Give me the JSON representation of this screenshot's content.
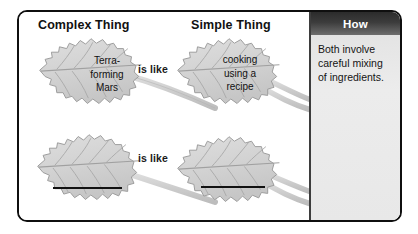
{
  "diagram": {
    "type": "analogy-graphic-organizer",
    "columns": {
      "complex_heading": "Complex Thing",
      "simple_heading": "Simple Thing",
      "how_heading": "How"
    },
    "relation_label_1": "is like",
    "relation_label_2": "is like",
    "rows": [
      {
        "complex_text": "Terra-\nforming\nMars",
        "simple_text": "cooking\nusing a\nrecipe",
        "filled": true
      },
      {
        "complex_text": "",
        "simple_text": "",
        "filled": false
      }
    ],
    "how_text": "Both involve careful mixing of ingredients.",
    "colors": {
      "leaf_fill": "#d4d4d4",
      "leaf_stroke": "#9a9a9a",
      "stem": "#cfcfcf",
      "panel_bg": "#e9e9e9",
      "header_bg": "#2e2e2e",
      "frame_border": "#0f0f0f",
      "text": "#111111"
    }
  }
}
